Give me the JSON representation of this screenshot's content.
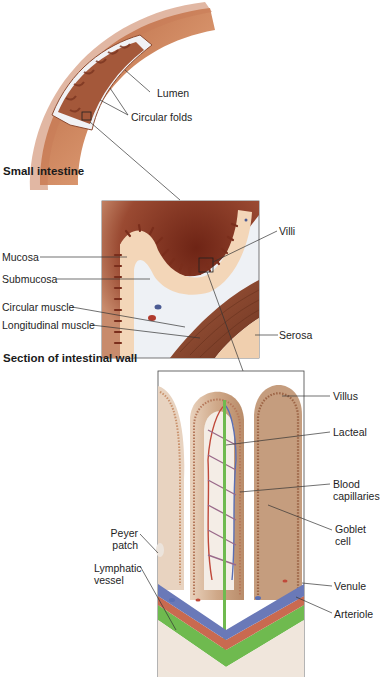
{
  "figure": {
    "panels": [
      {
        "id": "small-intestine",
        "title": "Small intestine",
        "labels": [
          "Lumen",
          "Circular folds"
        ]
      },
      {
        "id": "intestinal-wall",
        "title": "Section of intestinal wall",
        "labels": [
          "Villi",
          "Mucosa",
          "Submucosa",
          "Circular muscle",
          "Longitudinal muscle",
          "Serosa"
        ]
      },
      {
        "id": "villus-detail",
        "labels": [
          "Villus",
          "Lacteal",
          "Blood capillaries",
          "Goblet cell",
          "Peyer patch",
          "Lymphatic vessel",
          "Venule",
          "Arteriole"
        ]
      }
    ]
  },
  "labels": {
    "lumen": "Lumen",
    "circular_folds": "Circular folds",
    "small_intestine": "Small intestine",
    "villi": "Villi",
    "mucosa": "Mucosa",
    "submucosa": "Submucosa",
    "circular_muscle": "Circular muscle",
    "longitudinal_muscle": "Longitudinal muscle",
    "serosa": "Serosa",
    "section_title": "Section of intestinal wall",
    "villus": "Villus",
    "lacteal": "Lacteal",
    "blood_1": "Blood",
    "blood_2": "capillaries",
    "goblet_1": "Goblet",
    "goblet_2": "cell",
    "peyer_1": "Peyer",
    "peyer_2": "patch",
    "lymph_1": "Lymphatic",
    "lymph_2": "vessel",
    "venule": "Venule",
    "arteriole": "Arteriole"
  },
  "colors": {
    "tissue_dark": "#7a2e1c",
    "tissue_mid": "#b0603f",
    "tissue_light": "#f2d3b4",
    "submucosa": "#e6ebf1",
    "muscle": "#8a4a32",
    "artery": "#c0493a",
    "vein": "#5a6fb4",
    "lymph": "#5fb34a",
    "villus_tan": "#c9a383",
    "line": "#333333"
  }
}
